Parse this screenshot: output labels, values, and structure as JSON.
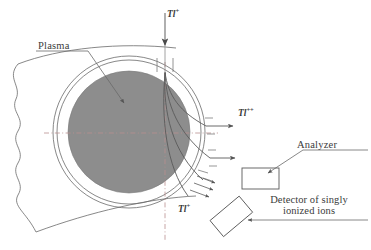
{
  "figure": {
    "type": "schematic-diagram",
    "background_color": "#ffffff",
    "line_color": "#5a5a5a",
    "plasma_fill_color": "#8c8c8c",
    "axis_color": "#b08a8a"
  },
  "labels": {
    "plasma": "Plasma",
    "analyzer": "Analyzer",
    "detector_line1": "Detector of singly",
    "detector_line2": "ionized ions"
  },
  "ions": {
    "injected": {
      "symbol": "Tl",
      "charge": "+",
      "position": "top"
    },
    "doubly_ionized": {
      "symbol": "Tl",
      "charge": "++",
      "position": "right"
    },
    "singly_ionized": {
      "symbol": "Tl",
      "charge": "+",
      "position": "bottom"
    }
  },
  "elements": {
    "plasma_disk": "shaded-gray-circle",
    "vacuum_vessel_inner": "thin-circle-outline",
    "vacuum_vessel_outer": "thin-circle-outline",
    "plasma_boundary": "wavy-left-boundary",
    "injection_arrow": "downward-arrow",
    "trajectories": "four-curved-ion-paths",
    "exit_arrows_right": "two-horizontal-arrows",
    "exit_arrows_lower": "three-diagonal-arrows",
    "analyzer_box": "rectangle",
    "detector_box": "rotated-rectangle",
    "axis_horizontal": "dash-dot-line",
    "axis_vertical": "dash-dot-line",
    "leader_lines": "label-pointer-lines"
  }
}
